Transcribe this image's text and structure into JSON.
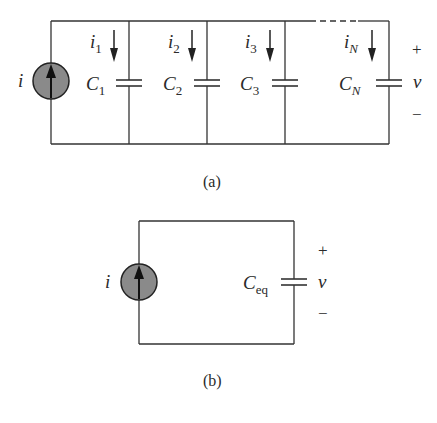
{
  "figure_a": {
    "caption": "(a)",
    "source_label": "i",
    "branches": [
      {
        "current": "i",
        "current_sub": "1",
        "cap": "C",
        "cap_sub": "1"
      },
      {
        "current": "i",
        "current_sub": "2",
        "cap": "C",
        "cap_sub": "2"
      },
      {
        "current": "i",
        "current_sub": "3",
        "cap": "C",
        "cap_sub": "3"
      },
      {
        "current": "i",
        "current_sub": "N",
        "cap": "C",
        "cap_sub": "N"
      }
    ],
    "voltage": {
      "plus": "+",
      "label": "v",
      "minus": "−"
    }
  },
  "figure_b": {
    "caption": "(b)",
    "source_label": "i",
    "cap": "C",
    "cap_sub": "eq",
    "voltage": {
      "plus": "+",
      "label": "v",
      "minus": "−"
    }
  },
  "colors": {
    "wire": "#333333",
    "source_fill": "#8a8a8a"
  }
}
